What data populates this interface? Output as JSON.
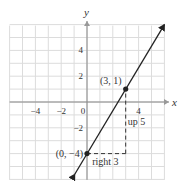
{
  "chart_data": {
    "type": "line",
    "title": "",
    "xlabel": "x",
    "ylabel": "y",
    "xlim": [
      -6,
      6
    ],
    "ylim": [
      -6,
      6
    ],
    "grid": true,
    "x_ticks": [
      {
        "value": -4,
        "label": "−4"
      },
      {
        "value": -2,
        "label": "−2"
      },
      {
        "value": 0,
        "label": "0"
      },
      {
        "value": 4,
        "label": "4"
      }
    ],
    "y_ticks": [
      {
        "value": 4,
        "label": "4"
      },
      {
        "value": 2,
        "label": "2"
      },
      {
        "value": -2,
        "label": "−2"
      }
    ],
    "series": [
      {
        "name": "line",
        "equation": "y = (5/3)x - 4",
        "slope": 1.667,
        "intercept": -4,
        "x": [
          -0.95,
          6.0
        ],
        "y": [
          -5.6,
          6.0
        ],
        "color": "#222222"
      }
    ],
    "points": [
      {
        "x": 0,
        "y": -4,
        "label": "(0, −4)"
      },
      {
        "x": 3,
        "y": 1,
        "label": "(3, 1)"
      }
    ],
    "annotations": [
      {
        "text": "right 3",
        "from": [
          0,
          -4
        ],
        "to": [
          3,
          -4
        ],
        "style": "dashed"
      },
      {
        "text": "up 5",
        "from": [
          3,
          -4
        ],
        "to": [
          3,
          1
        ],
        "style": "dashed"
      }
    ]
  },
  "colors": {
    "grid": "#dcdcdc",
    "axis": "#888888",
    "line": "#222222",
    "text": "#333333"
  }
}
